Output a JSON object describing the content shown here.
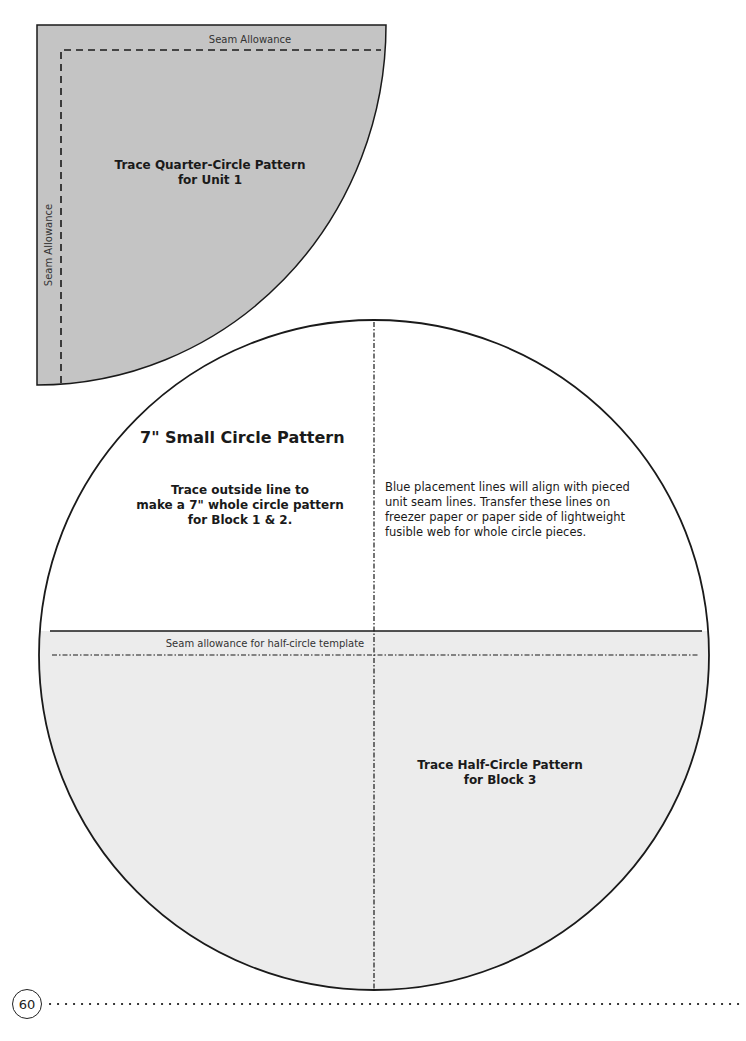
{
  "page": {
    "number": "60"
  },
  "quarter_circle": {
    "title_line1": "Trace Quarter-Circle Pattern",
    "title_line2": "for Unit 1",
    "seam_top_label": "Seam Allowance",
    "seam_left_label": "Seam Allowance",
    "fill_color": "#c4c4c4"
  },
  "small_circle": {
    "title": "7\" Small Circle Pattern",
    "instruction_line1": "Trace outside line to",
    "instruction_line2": "make a 7\" whole circle pattern",
    "instruction_line3": "for Block 1 & 2.",
    "note": "Blue placement lines will align with pieced unit seam lines. Transfer these lines on freezer paper or paper side of lightweight fusible web for whole circle pieces.",
    "note_lines": [
      "Blue placement lines will align with pieced",
      "unit seam lines. Transfer these lines on",
      "freezer paper or paper side of lightweight",
      "fusible web for whole circle pieces."
    ]
  },
  "half_circle": {
    "seam_label": "Seam allowance for half-circle template",
    "title_line1": "Trace Half-Circle Pattern",
    "title_line2": "for Block 3",
    "fill_color": "#ececec"
  }
}
